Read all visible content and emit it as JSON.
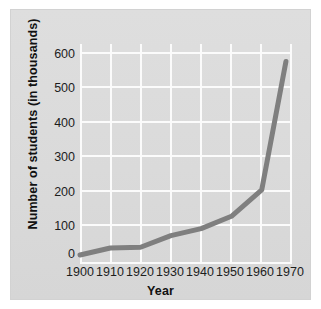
{
  "chart_data": {
    "type": "line",
    "title": "",
    "xlabel": "Year",
    "ylabel": "Number of students (in thousands)",
    "x": [
      1900,
      1910,
      1920,
      1930,
      1940,
      1950,
      1960,
      1968
    ],
    "values": [
      20,
      40,
      42,
      75,
      95,
      130,
      205,
      570
    ],
    "series": [
      {
        "name": "Number of students",
        "values": [
          20,
          40,
          42,
          75,
          95,
          130,
          205,
          570
        ]
      }
    ],
    "xticks": [
      "1900",
      "1910",
      "1920",
      "1930",
      "1940",
      "1950",
      "1960",
      "1970"
    ],
    "xtick_values": [
      1900,
      1910,
      1920,
      1930,
      1940,
      1950,
      1960,
      1970
    ],
    "yticks": [
      "0",
      "100",
      "200",
      "300",
      "400",
      "500",
      "600"
    ],
    "ytick_values": [
      0,
      100,
      200,
      300,
      400,
      500,
      600
    ],
    "xlim": [
      1900,
      1970
    ],
    "ylim": [
      0,
      620
    ],
    "grid": true,
    "grid_color": "#fbfbfb",
    "legend": "none",
    "line_color": "#7f7f7f",
    "line_width": 5,
    "plot_background": "#dcdcdc",
    "page_background": "#ffffff",
    "tick_label_color": "#1d1d1d",
    "axis_label_color": "#111111"
  }
}
